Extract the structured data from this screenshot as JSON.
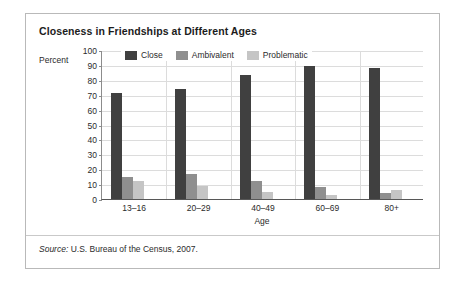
{
  "figure": {
    "title": "Closeness in Friendships at Different Ages",
    "source_keyword": "Source:",
    "source_text": "U.S. Bureau of the Census, 2007."
  },
  "colors": {
    "close": "#404040",
    "ambivalent": "#8f8f8f",
    "problematic": "#c5c5c5",
    "frame": "#b9b9b9",
    "grid": "#dcdcdc"
  },
  "chart_data": {
    "type": "bar",
    "title": "Closeness in Friendships at Different Ages",
    "xlabel": "Age",
    "ylabel": "Percent",
    "ylim": [
      0,
      100
    ],
    "yticks": [
      100,
      90,
      80,
      70,
      60,
      50,
      40,
      30,
      20,
      10,
      0
    ],
    "grid": true,
    "legend_position": "top-inside",
    "categories": [
      "13–16",
      "20–29",
      "40–49",
      "60–69",
      "80+"
    ],
    "series": [
      {
        "name": "Close",
        "values": [
          71,
          74,
          83,
          89,
          88
        ]
      },
      {
        "name": "Ambivalent",
        "values": [
          15,
          17,
          12,
          8,
          4
        ]
      },
      {
        "name": "Problematic",
        "values": [
          12,
          9,
          5,
          3,
          6
        ]
      }
    ]
  }
}
